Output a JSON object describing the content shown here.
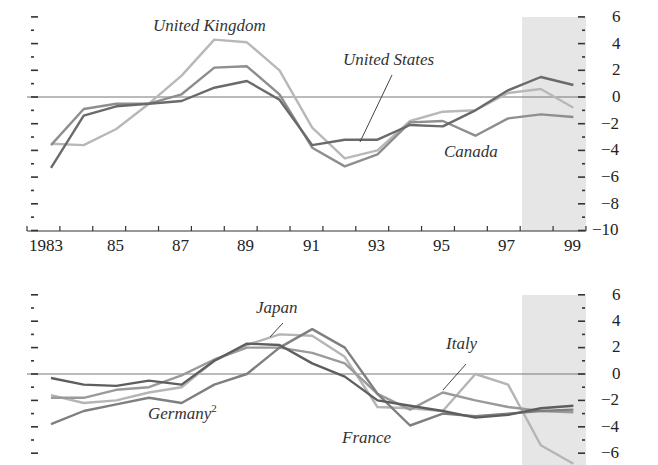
{
  "chart_data": [
    {
      "type": "line",
      "title": "",
      "xlabel": "",
      "ylabel": "",
      "x": [
        "1983",
        "1984",
        "1985",
        "1986",
        "1987",
        "1988",
        "1989",
        "1990",
        "1991",
        "1992",
        "1993",
        "1994",
        "1995",
        "1996",
        "1997",
        "1998",
        "1999"
      ],
      "xtick_labels": [
        "1983",
        "85",
        "87",
        "89",
        "91",
        "93",
        "95",
        "97",
        "99"
      ],
      "ytick_labels": [
        "6",
        "4",
        "2",
        "0",
        "-2",
        "-4",
        "-6",
        "-8",
        "-10"
      ],
      "ylim": [
        -10,
        6
      ],
      "grid": false,
      "zero_line": true,
      "shaded_region": {
        "from": "1997.5",
        "to": "1999.5",
        "color": "#e6e6e6"
      },
      "series": [
        {
          "name": "United Kingdom",
          "color": "#b8b8b8",
          "values": [
            -3.5,
            -3.6,
            -2.4,
            -0.5,
            1.6,
            4.3,
            4.1,
            2.0,
            -2.3,
            -4.6,
            -4.0,
            -1.8,
            -1.1,
            -1.0,
            0.3,
            0.6,
            -0.8
          ]
        },
        {
          "name": "Canada",
          "color": "#8e8e8e",
          "values": [
            -3.6,
            -0.9,
            -0.5,
            -0.5,
            0.2,
            2.2,
            2.3,
            0.2,
            -3.8,
            -5.2,
            -4.3,
            -1.9,
            -1.8,
            -2.9,
            -1.6,
            -1.3,
            -1.5
          ]
        },
        {
          "name": "United States",
          "color": "#6a6a6a",
          "values": [
            -5.3,
            -1.4,
            -0.7,
            -0.5,
            -0.3,
            0.7,
            1.2,
            -0.2,
            -3.6,
            -3.2,
            -3.2,
            -2.1,
            -2.2,
            -1.0,
            0.5,
            1.5,
            0.9
          ]
        }
      ],
      "annotations": [
        {
          "text": "United Kingdom"
        },
        {
          "text": "United States"
        },
        {
          "text": "Canada"
        }
      ]
    },
    {
      "type": "line",
      "title": "",
      "xlabel": "",
      "ylabel": "",
      "x": [
        "1983",
        "1984",
        "1985",
        "1986",
        "1987",
        "1988",
        "1989",
        "1990",
        "1991",
        "1992",
        "1993",
        "1994",
        "1995",
        "1996",
        "1997",
        "1998",
        "1999"
      ],
      "ytick_labels": [
        "6",
        "4",
        "2",
        "0",
        "-2",
        "-4",
        "-6"
      ],
      "ylim": [
        -6,
        6
      ],
      "grid": false,
      "zero_line": true,
      "shaded_region": {
        "from": "1997.5",
        "to": "1999.5",
        "color": "#e6e6e6"
      },
      "series": [
        {
          "name": "Japan",
          "color": "#b5b5b5",
          "values": [
            -1.6,
            -2.2,
            -2.0,
            -1.4,
            -1.0,
            1.0,
            2.2,
            3.0,
            2.9,
            1.3,
            -2.5,
            -2.6,
            -2.8,
            0.0,
            -0.8,
            -5.4,
            -6.8
          ]
        },
        {
          "name": "Italy",
          "color": "#9a9a9a",
          "values": [
            -1.8,
            -1.8,
            -1.2,
            -1.0,
            -0.1,
            1.1,
            2.0,
            2.0,
            1.6,
            0.8,
            -1.5,
            -2.7,
            -1.4,
            -2.0,
            -2.5,
            -2.8,
            -2.9
          ]
        },
        {
          "name": "France",
          "color": "#7f7f7f",
          "values": [
            -3.8,
            -2.8,
            -2.3,
            -1.8,
            -2.2,
            -0.8,
            0.0,
            2.0,
            3.4,
            2.0,
            -1.5,
            -3.9,
            -3.0,
            -3.2,
            -3.0,
            -2.8,
            -2.7
          ]
        },
        {
          "name": "Germany",
          "color": "#5e5e5e",
          "values": [
            -0.3,
            -0.8,
            -0.9,
            -0.5,
            -0.8,
            1.0,
            2.3,
            2.2,
            0.8,
            -0.2,
            -2.0,
            -2.4,
            -2.8,
            -3.3,
            -3.1,
            -2.6,
            -2.4
          ]
        }
      ],
      "annotations": [
        {
          "text": "Japan"
        },
        {
          "text": "Italy"
        },
        {
          "text": "Germany",
          "superscript": "2"
        },
        {
          "text": "France"
        }
      ]
    }
  ],
  "top": {
    "labels": {
      "uk": "United Kingdom",
      "us": "United States",
      "canada": "Canada"
    },
    "xticks": [
      "1983",
      "85",
      "87",
      "89",
      "91",
      "93",
      "95",
      "97",
      "99"
    ],
    "yticks": [
      "6",
      "4",
      "2",
      "0",
      "−2",
      "−4",
      "−6",
      "−8",
      "−10"
    ]
  },
  "bottom": {
    "labels": {
      "japan": "Japan",
      "italy": "Italy",
      "germany": "Germany",
      "germany_sup": "2",
      "france": "France"
    },
    "yticks": [
      "6",
      "4",
      "2",
      "0",
      "−2",
      "−4",
      "−6"
    ]
  }
}
